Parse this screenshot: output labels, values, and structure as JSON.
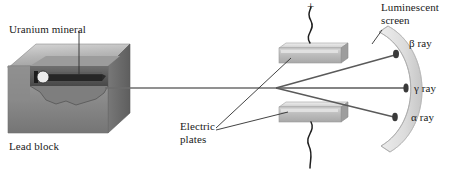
{
  "figure": {
    "width": 452,
    "height": 173,
    "background": "#ffffff"
  },
  "labels": {
    "uranium_mineral": "Uranium mineral",
    "lead_block": "Lead block",
    "electric_plates_line1": "Electric",
    "electric_plates_line2": "plates",
    "luminescent_screen_line1": "Luminescent",
    "luminescent_screen_line2": "screen",
    "plate_polarity_positive": "+",
    "beta_ray": "β ray",
    "gamma_ray": "γ ray",
    "alpha_ray": "α ray"
  },
  "components": {
    "lead_block": {
      "name": "Lead block",
      "top_face_color": "#b9b9b9",
      "front_face_color": "#8d8d8d",
      "right_face_color": "#6e6e6e",
      "cavity_color": "#3a3a3a",
      "channel_color": "#2b2b2b"
    },
    "uranium_sample": {
      "name": "Uranium mineral",
      "color": "#e8e8e8",
      "outline": "#1a1a1a"
    },
    "electric_plates": [
      {
        "name": "upper plate",
        "polarity": "+",
        "face_color": "#cfcfcf",
        "edge_color": "#9a9a9a"
      },
      {
        "name": "lower plate",
        "polarity": "",
        "face_color": "#cfcfcf",
        "edge_color": "#9a9a9a"
      }
    ],
    "luminescent_screen": {
      "name": "Luminescent screen",
      "shape": "curved arc band",
      "band_color": "#e3e3e3",
      "edge_color": "#b5b5b5"
    },
    "rays": [
      {
        "id": "beta",
        "label": "β ray",
        "deflection": "upward",
        "spot_color": "#3b3b3b"
      },
      {
        "id": "gamma",
        "label": "γ ray",
        "deflection": "undeflected",
        "spot_color": "#3b3b3b"
      },
      {
        "id": "alpha",
        "label": "α ray",
        "deflection": "downward",
        "spot_color": "#3b3b3b"
      }
    ],
    "beam_color": "#6a6a6a",
    "leader_line_color": "#4a4a4a",
    "wire_color": "#1f1f1f"
  }
}
